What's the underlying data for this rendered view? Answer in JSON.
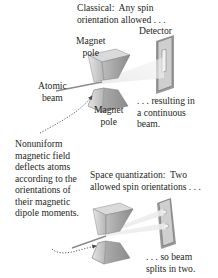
{
  "top": {
    "caption": "Classical:  Any spin\norientation allowed . . .",
    "detector_label": "Detector",
    "magnet_top_label": "Magnet\npole",
    "magnet_bottom_label": "Magnet\npole",
    "beam_label": "Atomic\nbeam",
    "result_label": ". . . resulting in\na continuous\nbeam."
  },
  "middle": {
    "explanation": "Nonuniform\nmagnetic field\ndeflects atoms\naccording to the\norientations of\ntheir magnetic\ndipole moments."
  },
  "bottom": {
    "caption": "Space quantization:  Two\nallowed spin orientations . . .",
    "result_label": ". . . so beam\nsplits in two."
  },
  "colors": {
    "magnet_light": "#d9d9d9",
    "magnet_mid": "#a8a8a8",
    "magnet_dark": "#7a7a7a",
    "detector_face": "#c8c8c8",
    "arrow": "#4a4a4a"
  }
}
